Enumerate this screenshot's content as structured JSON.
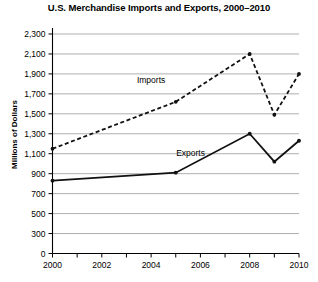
{
  "chart_data": {
    "type": "line",
    "title": "U.S. Merchandise Imports and Exports, 2000–2010",
    "xlabel": "",
    "ylabel": "Millions of Dollars",
    "x": [
      2000,
      2001,
      2002,
      2003,
      2004,
      2005,
      2006,
      2007,
      2008,
      2009,
      2010
    ],
    "xlim": [
      2000,
      2010
    ],
    "ylim": [
      0,
      2300
    ],
    "grid": true,
    "legend_position": "inline-annotations",
    "y_ticks": [
      0,
      300,
      500,
      700,
      900,
      1100,
      1300,
      1500,
      1700,
      1900,
      2100,
      2300
    ],
    "y_tick_labels": [
      "0",
      "300",
      "500",
      "700",
      "900",
      "1,100",
      "1,300",
      "1,500",
      "1,700",
      "1,900",
      "2,100",
      "2,300"
    ],
    "x_ticks": [
      2000,
      2001,
      2002,
      2003,
      2004,
      2005,
      2006,
      2007,
      2008,
      2009,
      2010
    ],
    "x_tick_labels_major": [
      "2000",
      "2002",
      "2004",
      "2006",
      "2008",
      "2010"
    ],
    "x_major_values": [
      2000,
      2002,
      2004,
      2006,
      2008,
      2010
    ],
    "series": [
      {
        "name": "Imports",
        "style": "dashed",
        "color": "#111111",
        "x": [
          2000,
          2005,
          2008,
          2009,
          2010
        ],
        "values": [
          1150,
          1620,
          2100,
          1490,
          1900
        ]
      },
      {
        "name": "Exports",
        "style": "solid",
        "color": "#111111",
        "x": [
          2000,
          2005,
          2008,
          2009,
          2010
        ],
        "values": [
          830,
          910,
          1300,
          1020,
          1230
        ]
      }
    ],
    "annotations": [
      {
        "text": "Imports",
        "x": 2004.0,
        "y": 1810
      },
      {
        "text": "Exports",
        "x": 2005.6,
        "y": 1075
      }
    ]
  }
}
